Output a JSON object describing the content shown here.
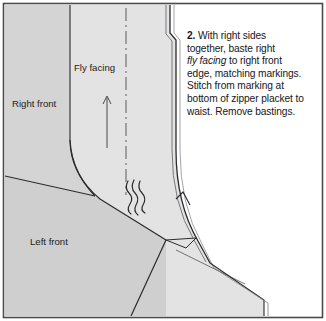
{
  "figure": {
    "border_color": "#4a4a4a",
    "background": "#ffffff",
    "fabric_light": "#e3e3e3",
    "fabric_mid": "#d4d4d4",
    "fabric_dark": "#cacaca",
    "line_color": "#2b2b2e",
    "labels": {
      "fly_facing": "Fly facing",
      "right_front": "Right front",
      "left_front": "Left front"
    },
    "markings": {
      "center_line": "center-front-dash-dot-line",
      "grainline_arrow": "grainline-arrow-up",
      "basting_threads": "basting-thread-squiggles",
      "notch": "placket-bottom-notch"
    }
  },
  "caption": {
    "step_number": "2.",
    "line1": " With right sides",
    "line2": "together, baste right",
    "line3_em": "fly facing",
    "line3_rest": " to right front",
    "line4": "edge, matching markings.",
    "line5": "Stitch from marking at",
    "line6": "bottom of zipper placket to",
    "line7": "waist. Remove bastings."
  }
}
